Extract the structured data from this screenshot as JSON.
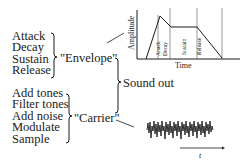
{
  "envelope_group": {
    "items": [
      "Attack",
      "Decay",
      "Sustain",
      "Release"
    ],
    "label": "\"Envelope\""
  },
  "carrier_group": {
    "items": [
      "Add tones",
      "Filter tones",
      "Add noise",
      "Modulate",
      "Sample"
    ],
    "label": "\"Carrier\""
  },
  "output": {
    "label": "Sound out"
  },
  "adsr_chart": {
    "y_axis_label": "Amplitude",
    "x_axis_label": "Time",
    "phases": [
      "Attack",
      "Decay",
      "Sustain",
      "Release"
    ]
  },
  "waveform": {
    "axis_label": "t"
  },
  "colors": {
    "ink": "#1a1a1a",
    "background": "#ffffff"
  }
}
